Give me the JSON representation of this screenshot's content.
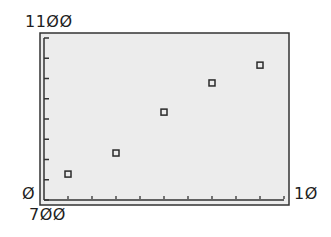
{
  "chart_data": {
    "type": "scatter",
    "title": "",
    "xlabel": "",
    "ylabel": "",
    "x": [
      1,
      3,
      5,
      7,
      9
    ],
    "series": [
      {
        "name": "data",
        "values": [
          764,
          816,
          917,
          989,
          1033
        ]
      }
    ],
    "xlim": [
      0,
      10
    ],
    "ylim": [
      700,
      1100
    ],
    "x_tick_step": 1,
    "y_tick_step": 50,
    "grid": false,
    "legend": null,
    "marker": "hollow-square"
  },
  "labels": {
    "y_max": "11ØØ",
    "x_min": "Ø",
    "y_min": "7ØØ",
    "x_max": "1Ø"
  },
  "colors": {
    "plot_bg": "#ececec",
    "frame": "#333333",
    "marker": "#2a2a2a",
    "text": "#1e1e1e"
  }
}
